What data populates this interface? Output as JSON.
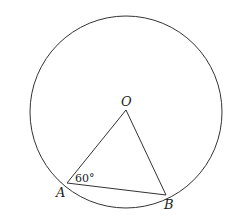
{
  "diagram": {
    "points": {
      "O": {
        "label": "O"
      },
      "A": {
        "label": "A"
      },
      "B": {
        "label": "B"
      }
    },
    "angle_label": "60°",
    "colors": {
      "stroke": "#333333",
      "background": "#ffffff"
    }
  }
}
